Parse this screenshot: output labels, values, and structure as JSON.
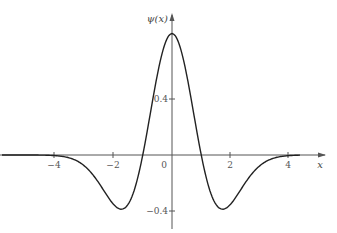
{
  "chart_data": {
    "type": "line",
    "title": "",
    "function": "Mexican hat wavelet: ψ(x) = (2/(√3·π^(1/4)))·(1 − x²)·e^(−x²/2)",
    "xlabel": "x",
    "ylabel": "ψ(x)",
    "xlim": [
      -5.9,
      5.5
    ],
    "ylim": [
      -0.55,
      0.95
    ],
    "grid": false,
    "legend": null,
    "x_ticks": [
      -4,
      -2,
      0,
      2,
      4
    ],
    "x_tick_labels": [
      "−4",
      "−2",
      "0",
      "2",
      "4"
    ],
    "y_ticks": [
      0.4,
      -0.4
    ],
    "y_tick_labels": [
      "0.4",
      "−0.4"
    ],
    "series": [
      {
        "name": "ψ(x)",
        "color": "#222222",
        "x": [
          -5.5,
          -4,
          -3,
          -2.5,
          -2,
          -1.732,
          -1.5,
          -1,
          -0.5,
          0,
          0.5,
          1,
          1.5,
          1.732,
          2,
          2.5,
          3,
          4,
          5.5
        ],
        "y": [
          -0.0005,
          -0.0157,
          -0.0867,
          -0.196,
          -0.352,
          -0.386,
          -0.353,
          0,
          0.571,
          0.867,
          0.571,
          0,
          -0.353,
          -0.386,
          -0.352,
          -0.196,
          -0.0867,
          -0.0157,
          -0.0005
        ]
      }
    ]
  },
  "labels": {
    "ylabel": "ψ(x)",
    "xlabel": "x",
    "x_ticks": [
      "−4",
      "−2",
      "0",
      "2",
      "4"
    ],
    "y_pos": "0.4",
    "y_neg": "−0.4"
  },
  "colors": {
    "curve": "#222222",
    "axis": "#555555"
  }
}
